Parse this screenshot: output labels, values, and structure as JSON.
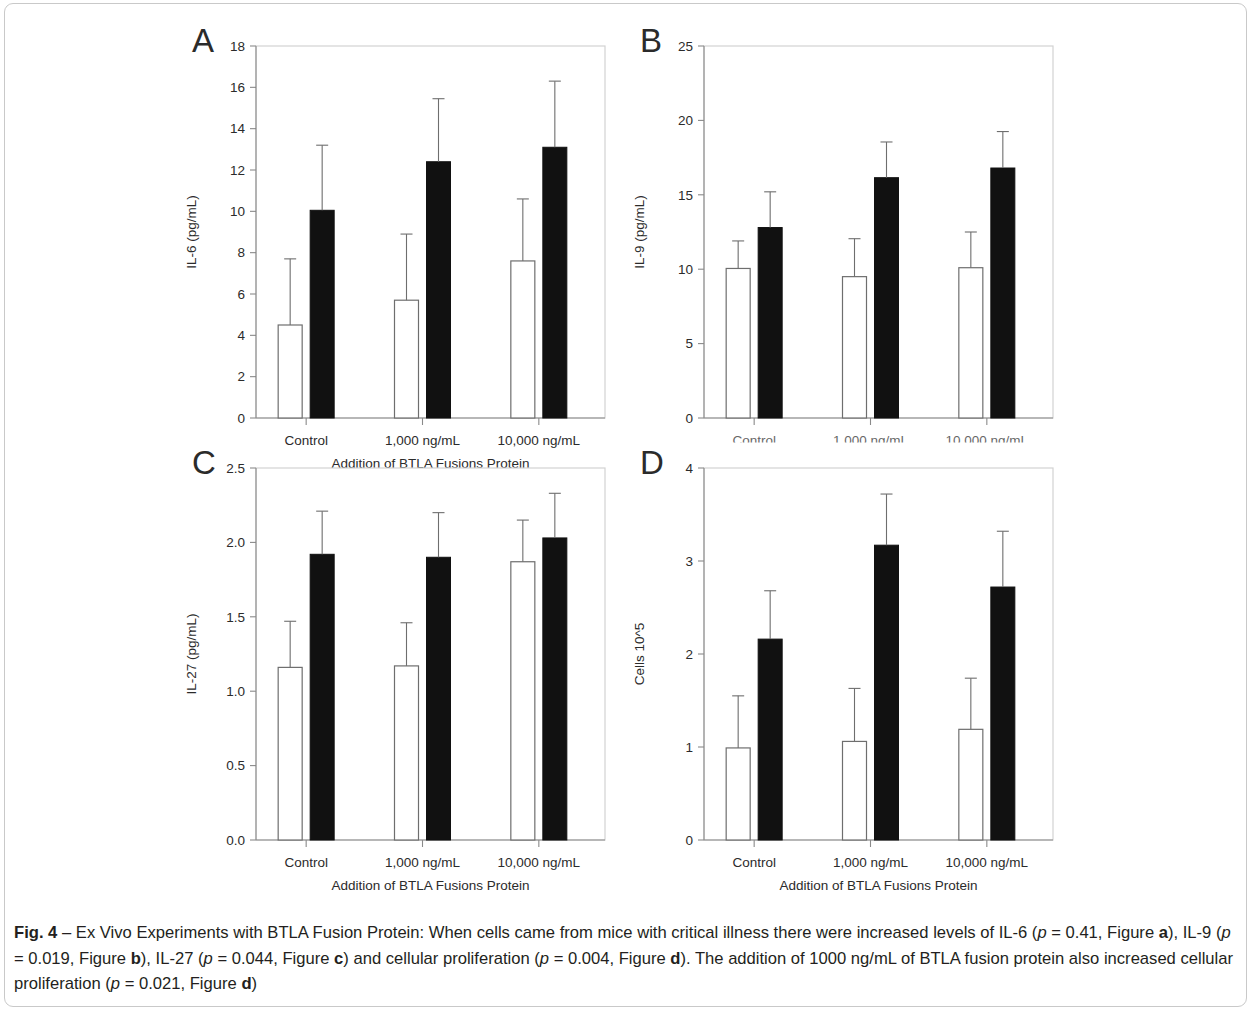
{
  "figure": {
    "label": "Fig. 4",
    "dash": "–",
    "caption_part1": "Ex Vivo Experiments with BTLA Fusion Protein: When cells came from mice with critical illness there were increased levels of IL-6 (",
    "p1_var": "p",
    "p1_eq": " = 0.41,",
    "caption_part2": "Figure ",
    "fig_a": "a",
    "caption_part3": "), IL-9 (",
    "p2_var": "p",
    "p2_eq": " = 0.019, Figure ",
    "fig_b": "b",
    "caption_part4": "), IL-27 (",
    "p3_var": "p",
    "p3_eq": " = 0.044, Figure ",
    "fig_c": "c",
    "caption_part5": ") and cellular proliferation (",
    "p4_var": "p",
    "p4_eq": " = 0.004, Figure ",
    "fig_d": "d",
    "caption_part6": "). The addition of 1000 ng/mL of BTLA fusion protein also increased cellular proliferation (",
    "p5_var": "p",
    "p5_eq": " = 0.021, Figure ",
    "fig_d2": "d",
    "caption_part7": ")"
  },
  "colors": {
    "bar_open_fill": "#ffffff",
    "bar_open_stroke": "#6e6e6e",
    "bar_filled": "#111111",
    "axis": "#8a8a8a",
    "frame": "#d2d2d2",
    "text": "#2b2b2b",
    "outer_border": "#c9c9c9"
  },
  "chart_data": [
    {
      "id": "A",
      "panel_letter": "A",
      "type": "bar",
      "title": "",
      "ylabel": "IL-6 (pg/mL)",
      "xlabel": "Addition of BTLA Fusions Protein",
      "categories": [
        "Control",
        "1,000 ng/mL",
        "10,000 ng/mL"
      ],
      "ylim": [
        0,
        18
      ],
      "yticks": [
        0,
        2,
        4,
        6,
        8,
        10,
        12,
        14,
        16,
        18
      ],
      "ytick_labels": [
        "0",
        "2",
        "4",
        "6",
        "8",
        "10",
        "12",
        "14",
        "16",
        "18"
      ],
      "grid": false,
      "legend_position": "none",
      "xlabels_clipped": false,
      "series": [
        {
          "name": "open",
          "style": "open",
          "values": [
            4.5,
            5.7,
            7.6
          ],
          "errors": [
            3.2,
            3.2,
            3.0
          ]
        },
        {
          "name": "filled",
          "style": "filled",
          "values": [
            10.05,
            12.4,
            13.1
          ],
          "errors": [
            3.15,
            3.05,
            3.2
          ]
        }
      ]
    },
    {
      "id": "B",
      "panel_letter": "B",
      "type": "bar",
      "title": "",
      "ylabel": "IL-9 (pg/mL)",
      "xlabel": "Addition of BTLA Fusions Protein",
      "categories": [
        "Control",
        "1,000 ng/mL",
        "10,000 ng/mL"
      ],
      "ylim": [
        0,
        25
      ],
      "yticks": [
        0,
        5,
        10,
        15,
        20,
        25
      ],
      "ytick_labels": [
        "0",
        "5",
        "10",
        "15",
        "20",
        "25"
      ],
      "grid": false,
      "legend_position": "none",
      "xlabels_clipped": true,
      "series": [
        {
          "name": "open",
          "style": "open",
          "values": [
            10.05,
            9.5,
            10.1
          ],
          "errors": [
            1.85,
            2.55,
            2.4
          ]
        },
        {
          "name": "filled",
          "style": "filled",
          "values": [
            12.8,
            16.15,
            16.8
          ],
          "errors": [
            2.4,
            2.4,
            2.45
          ]
        }
      ]
    },
    {
      "id": "C",
      "panel_letter": "C",
      "type": "bar",
      "title": "",
      "ylabel": "IL-27 (pg/mL)",
      "xlabel": "Addition of BTLA Fusions Protein",
      "categories": [
        "Control",
        "1,000 ng/mL",
        "10,000 ng/mL"
      ],
      "ylim": [
        0,
        2.5
      ],
      "yticks": [
        0,
        0.5,
        1.0,
        1.5,
        2.0,
        2.5
      ],
      "ytick_labels": [
        "0.0",
        "0.5",
        "1.0",
        "1.5",
        "2.0",
        "2.5"
      ],
      "grid": false,
      "legend_position": "none",
      "xlabels_clipped": false,
      "series": [
        {
          "name": "open",
          "style": "open",
          "values": [
            1.16,
            1.17,
            1.87
          ],
          "errors": [
            0.31,
            0.29,
            0.28
          ]
        },
        {
          "name": "filled",
          "style": "filled",
          "values": [
            1.92,
            1.9,
            2.03,
            0
          ],
          "errors": [
            0.29,
            0.3,
            0.3
          ]
        }
      ]
    },
    {
      "id": "D",
      "panel_letter": "D",
      "type": "bar",
      "title": "",
      "ylabel": "Cells 10^5",
      "xlabel": "Addition of BTLA Fusions Protein",
      "categories": [
        "Control",
        "1,000 ng/mL",
        "10,000 ng/mL"
      ],
      "ylim": [
        0,
        4
      ],
      "yticks": [
        0,
        1,
        2,
        3,
        4
      ],
      "ytick_labels": [
        "0",
        "1",
        "2",
        "3",
        "4"
      ],
      "grid": false,
      "legend_position": "none",
      "xlabels_clipped": false,
      "series": [
        {
          "name": "open",
          "style": "open",
          "values": [
            0.99,
            1.06,
            1.19
          ],
          "errors": [
            0.56,
            0.57,
            0.55
          ]
        },
        {
          "name": "filled",
          "style": "filled",
          "values": [
            2.16,
            3.17,
            2.72
          ],
          "errors": [
            0.52,
            0.55,
            0.6
          ]
        }
      ]
    }
  ]
}
